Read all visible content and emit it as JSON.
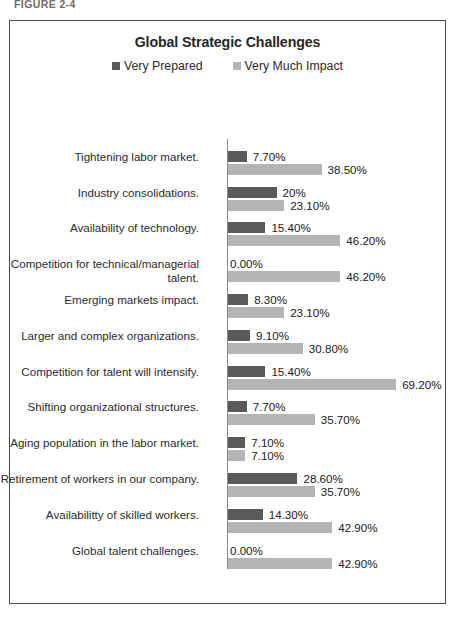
{
  "figure": {
    "caption": "FIGURE 2-4"
  },
  "chart_data": {
    "type": "bar",
    "orientation": "horizontal",
    "title": "Global Strategic Challenges",
    "xlabel": "",
    "ylabel": "",
    "grid": false,
    "legend_position": "top-center",
    "xlim": [
      0,
      72
    ],
    "colors": {
      "very_prepared": "#5a5a5a",
      "very_much_impact": "#b4b4b4",
      "axis": "#8a8a8a",
      "frame": "#4a4a4a",
      "text": "#2b2b2b"
    },
    "categories": [
      "Tightening labor market.",
      "Industry consolidations.",
      "Availability of technology.",
      "Competition for technical/managerial talent.",
      "Emerging markets impact.",
      "Larger and complex organizations.",
      "Competition for talent will intensify.",
      "Shifting organizational structures.",
      "Aging population in the labor market.",
      "Retirement of workers in  our company.",
      "Availabilitty of skilled workers.",
      "Global talent challenges."
    ],
    "series": [
      {
        "name": "Very Prepared",
        "color": "#5a5a5a",
        "values": [
          7.7,
          20,
          15.4,
          0,
          8.3,
          9.1,
          15.4,
          7.7,
          7.1,
          28.6,
          14.3,
          0
        ],
        "labels": [
          "7.70%",
          "20%",
          "15.40%",
          "0.00%",
          "8.30%",
          "9.10%",
          "15.40%",
          "7.70%",
          "7.10%",
          "28.60%",
          "14.30%",
          "0.00%"
        ]
      },
      {
        "name": "Very Much Impact",
        "color": "#b4b4b4",
        "values": [
          38.5,
          23.1,
          46.2,
          46.2,
          23.1,
          30.8,
          69.2,
          35.7,
          7.1,
          35.7,
          42.9,
          42.9
        ],
        "labels": [
          "38.50%",
          "23.10%",
          "46.20%",
          "46.20%",
          "23.10%",
          "30.80%",
          "69.20%",
          "35.70%",
          "7.10%",
          "35.70%",
          "42.90%",
          "42.90%"
        ]
      }
    ]
  }
}
